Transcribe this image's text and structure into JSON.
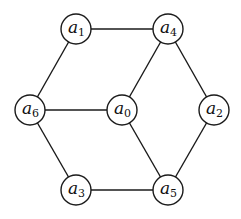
{
  "graph": {
    "nodes": [
      {
        "id": "a0",
        "base": "a",
        "sub": "0",
        "x": 122,
        "y": 110
      },
      {
        "id": "a1",
        "base": "a",
        "sub": "1",
        "x": 76,
        "y": 29
      },
      {
        "id": "a2",
        "base": "a",
        "sub": "2",
        "x": 214,
        "y": 110
      },
      {
        "id": "a3",
        "base": "a",
        "sub": "3",
        "x": 76,
        "y": 190
      },
      {
        "id": "a4",
        "base": "a",
        "sub": "4",
        "x": 168,
        "y": 29
      },
      {
        "id": "a5",
        "base": "a",
        "sub": "5",
        "x": 168,
        "y": 190
      },
      {
        "id": "a6",
        "base": "a",
        "sub": "6",
        "x": 30,
        "y": 110
      }
    ],
    "edges": [
      [
        "a1",
        "a4"
      ],
      [
        "a1",
        "a6"
      ],
      [
        "a4",
        "a0"
      ],
      [
        "a4",
        "a2"
      ],
      [
        "a6",
        "a0"
      ],
      [
        "a6",
        "a3"
      ],
      [
        "a0",
        "a5"
      ],
      [
        "a2",
        "a5"
      ],
      [
        "a3",
        "a5"
      ]
    ],
    "node_radius": 15
  }
}
